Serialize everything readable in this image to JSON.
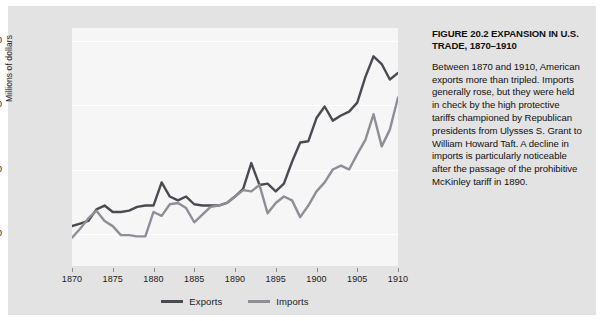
{
  "figure": {
    "caption_title": "FIGURE 20.2  EXPANSION IN U.S. TRADE, 1870–1910",
    "caption_body": "Between 1870 and 1910, American exports more than tripled. Imports generally rose, but they were held in check by the high protective tariffs championed by Republican presidents from Ulysses S. Grant to William Howard Taft. A decline in imports is particularly noticeable after the passage of the prohibitive McKinley tariff in 1890."
  },
  "colors": {
    "exports_line": "#4a4a52",
    "imports_line": "#8e8e96",
    "card_background": "#e3e3e3",
    "plot_background": "#f6f6f6",
    "gridline": "#ffffff",
    "text": "#1b1b1b"
  },
  "legend": {
    "entries": [
      {
        "label": "Exports",
        "color": "#4a4a52"
      },
      {
        "label": "Imports",
        "color": "#8e8e96"
      }
    ]
  },
  "chart_data": {
    "type": "line",
    "title": "FIGURE 20.2  EXPANSION IN U.S. TRADE, 1870–1910",
    "xlabel": "",
    "ylabel": "Millions of dollars",
    "xlim": [
      1870,
      1910
    ],
    "ylim": [
      250,
      2100
    ],
    "grid": true,
    "legend_position": "bottom-center",
    "x_tick_labels": [
      "1870",
      "1875",
      "1880",
      "1885",
      "1890",
      "1895",
      "1900",
      "1905",
      "1910"
    ],
    "x_ticks": [
      1870,
      1875,
      1880,
      1885,
      1890,
      1895,
      1900,
      1905,
      1910
    ],
    "y_tick_labels": [
      "500",
      "1,000",
      "1,500",
      "2,000"
    ],
    "y_ticks": [
      500,
      1000,
      1500,
      2000
    ],
    "x": [
      1870,
      1871,
      1872,
      1873,
      1874,
      1875,
      1876,
      1877,
      1878,
      1879,
      1880,
      1881,
      1882,
      1883,
      1884,
      1885,
      1886,
      1887,
      1888,
      1889,
      1890,
      1891,
      1892,
      1893,
      1894,
      1895,
      1896,
      1897,
      1898,
      1899,
      1900,
      1901,
      1902,
      1903,
      1904,
      1905,
      1906,
      1907,
      1908,
      1909,
      1910
    ],
    "series": [
      {
        "name": "Exports",
        "color": "#4a4a52",
        "values": [
          560,
          580,
          600,
          690,
          720,
          670,
          670,
          680,
          710,
          720,
          720,
          900,
          790,
          760,
          790,
          730,
          720,
          720,
          720,
          740,
          790,
          850,
          1050,
          880,
          890,
          830,
          890,
          1060,
          1210,
          1220,
          1400,
          1490,
          1380,
          1420,
          1450,
          1520,
          1720,
          1880,
          1820,
          1700,
          1750
        ]
      },
      {
        "name": "Imports",
        "color": "#8e8e96",
        "values": [
          470,
          540,
          620,
          680,
          600,
          560,
          490,
          490,
          480,
          480,
          670,
          640,
          730,
          740,
          700,
          590,
          650,
          710,
          720,
          740,
          790,
          840,
          830,
          880,
          660,
          740,
          790,
          760,
          630,
          720,
          830,
          900,
          1000,
          1030,
          1000,
          1120,
          1230,
          1430,
          1180,
          1310,
          1560
        ]
      }
    ]
  }
}
